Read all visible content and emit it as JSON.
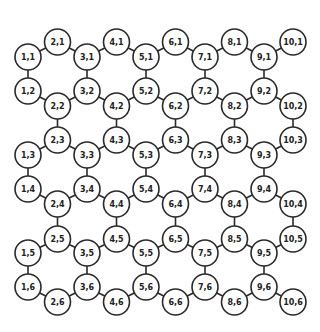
{
  "diagram": {
    "title": "",
    "columns": 10,
    "rows": 6,
    "colors": {
      "stroke": "#2a2a2a",
      "fill": "#ffffff",
      "text": "#222222",
      "background": "#ffffff"
    },
    "node_radius": 13,
    "column_x": [
      28,
      57.5,
      87,
      116.5,
      146,
      175.5,
      205,
      234.5,
      264,
      293
    ],
    "row_y_odd_columns": [
      57,
      91,
      155,
      189,
      253,
      287
    ],
    "row_y_even_columns": [
      42,
      106,
      140,
      204,
      239,
      302
    ],
    "edges_rule": "each row is a zigzag chain across all 10 columns; odd columns link rows 1-2, 3-4, 5-6 vertically; even columns link rows 2-3, 4-5 vertically",
    "nodes": [
      {
        "label": "1,1"
      },
      {
        "label": "2,1"
      },
      {
        "label": "3,1"
      },
      {
        "label": "4,1"
      },
      {
        "label": "5,1"
      },
      {
        "label": "6,1"
      },
      {
        "label": "7,1"
      },
      {
        "label": "8,1"
      },
      {
        "label": "9,1"
      },
      {
        "label": "10,1"
      },
      {
        "label": "1,2"
      },
      {
        "label": "2,2"
      },
      {
        "label": "3,2"
      },
      {
        "label": "4,2"
      },
      {
        "label": "5,2"
      },
      {
        "label": "6,2"
      },
      {
        "label": "7,2"
      },
      {
        "label": "8,2"
      },
      {
        "label": "9,2"
      },
      {
        "label": "10,2"
      },
      {
        "label": "1,3"
      },
      {
        "label": "2,3"
      },
      {
        "label": "3,3"
      },
      {
        "label": "4,3"
      },
      {
        "label": "5,3"
      },
      {
        "label": "6,3"
      },
      {
        "label": "7,3"
      },
      {
        "label": "8,3"
      },
      {
        "label": "9,3"
      },
      {
        "label": "10,3"
      },
      {
        "label": "1,4"
      },
      {
        "label": "2,4"
      },
      {
        "label": "3,4"
      },
      {
        "label": "4,4"
      },
      {
        "label": "5,4"
      },
      {
        "label": "6,4"
      },
      {
        "label": "7,4"
      },
      {
        "label": "8,4"
      },
      {
        "label": "9,4"
      },
      {
        "label": "10,4"
      },
      {
        "label": "1,5"
      },
      {
        "label": "2,5"
      },
      {
        "label": "3,5"
      },
      {
        "label": "4,5"
      },
      {
        "label": "5,5"
      },
      {
        "label": "6,5"
      },
      {
        "label": "7,5"
      },
      {
        "label": "8,5"
      },
      {
        "label": "9,5"
      },
      {
        "label": "10,5"
      },
      {
        "label": "1,6"
      },
      {
        "label": "2,6"
      },
      {
        "label": "3,6"
      },
      {
        "label": "4,6"
      },
      {
        "label": "5,6"
      },
      {
        "label": "6,6"
      },
      {
        "label": "7,6"
      },
      {
        "label": "8,6"
      },
      {
        "label": "9,6"
      },
      {
        "label": "10,6"
      }
    ]
  }
}
